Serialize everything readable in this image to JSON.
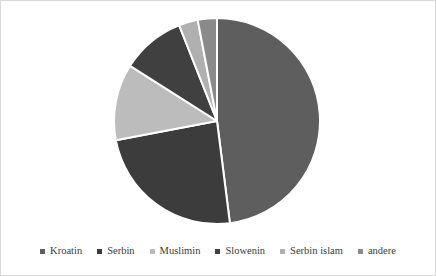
{
  "figure": {
    "background_color": "#ffffff",
    "border_color": "#d9d9d9",
    "slice_separator_color": "#ffffff"
  },
  "legend": {
    "position": "bottom",
    "marker_icon": "square-marker-icon",
    "entries": [
      {
        "label": "Kroatin",
        "color": "#5e5e5e"
      },
      {
        "label": "Serbin",
        "color": "#3c3c3c"
      },
      {
        "label": "Muslimin",
        "color": "#bcbcbc"
      },
      {
        "label": "Slowenin",
        "color": "#404040"
      },
      {
        "label": "Serbin islam",
        "color": "#b0b0b0"
      },
      {
        "label": "andere",
        "color": "#8a8a8a"
      }
    ]
  },
  "chart_data": {
    "type": "pie",
    "title": "",
    "subtitle": "",
    "xlabel": "",
    "ylabel": "",
    "legend_position": "bottom",
    "grid": false,
    "start_angle_deg": 0,
    "direction": "clockwise",
    "labels": [
      "Kroatin",
      "Serbin",
      "Muslimin",
      "Slowenin",
      "Serbin islam",
      "andere"
    ],
    "values": [
      48,
      24,
      12,
      10,
      3,
      3
    ],
    "colors": [
      "#5e5e5e",
      "#3c3c3c",
      "#bcbcbc",
      "#404040",
      "#b0b0b0",
      "#8a8a8a"
    ],
    "slices": [
      {
        "label": "Kroatin",
        "value": 48,
        "color": "#5e5e5e"
      },
      {
        "label": "Serbin",
        "value": 24,
        "color": "#3c3c3c"
      },
      {
        "label": "Muslimin",
        "value": 12,
        "color": "#bcbcbc"
      },
      {
        "label": "Slowenin",
        "value": 10,
        "color": "#404040"
      },
      {
        "label": "Serbin islam",
        "value": 3,
        "color": "#b0b0b0"
      },
      {
        "label": "andere",
        "value": 3,
        "color": "#8a8a8a"
      }
    ]
  }
}
